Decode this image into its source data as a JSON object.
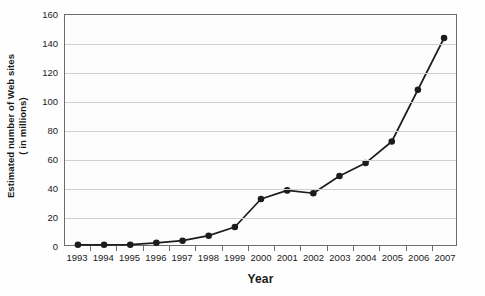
{
  "chart_data": {
    "type": "line",
    "title": "",
    "xlabel": "Year",
    "ylabel_line1": "Estimated number of Web sites",
    "ylabel_line2": "( in millions)",
    "categories": [
      "1993",
      "1994",
      "1995",
      "1996",
      "1997",
      "1998",
      "1999",
      "2000",
      "2001",
      "2002",
      "2003",
      "2004",
      "2005",
      "2006",
      "2007"
    ],
    "values": [
      0.1,
      0.1,
      0.2,
      1.5,
      3,
      6.5,
      12.5,
      32,
      38,
      36,
      48,
      57,
      72,
      108,
      144
    ],
    "series": [
      {
        "name": "Estimated number of Web sites (in millions)",
        "values": [
          0.1,
          0.1,
          0.2,
          1.5,
          3,
          6.5,
          12.5,
          32,
          38,
          36,
          48,
          57,
          72,
          108,
          144
        ]
      }
    ],
    "ylim": [
      0,
      160
    ],
    "ytick_labels": [
      "0",
      "20",
      "40",
      "60",
      "80",
      "100",
      "120",
      "140",
      "160"
    ],
    "ytick_values": [
      0,
      20,
      40,
      60,
      80,
      100,
      120,
      140,
      160
    ],
    "grid": true,
    "grid_axis": "y",
    "legend": false,
    "legend_position": "none",
    "marker": "filled-circle",
    "line_color": "#1c1c1c",
    "marker_color": "#1c1c1c",
    "grid_color": "#cfcfcf",
    "axis_color": "#6d6d6d",
    "plot_background": "#fdfdfd"
  }
}
